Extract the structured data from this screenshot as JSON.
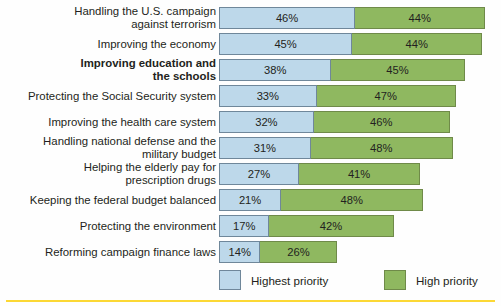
{
  "chart_data": {
    "type": "bar",
    "title": "",
    "xlabel": "",
    "ylabel": "",
    "orientation": "horizontal",
    "stacked": true,
    "grid": false,
    "legend_position": "bottom",
    "xlim": [
      0,
      90
    ],
    "axis_scale_px_per_percent": 2.96,
    "categories": [
      "Handling the U.S. campaign\nagainst terrorism",
      "Improving the economy",
      "Improving education and\nthe schools",
      "Protecting the Social Security system",
      "Improving the health care system",
      "Handling national defense and the\nmilitary budget",
      "Helping the elderly pay for\nprescription drugs",
      "Keeping the federal budget balanced",
      "Protecting the environment",
      "Reforming campaign finance laws"
    ],
    "series": [
      {
        "name": "Highest priority",
        "color": "#bdd8ea",
        "values": [
          46,
          45,
          38,
          33,
          32,
          31,
          27,
          21,
          17,
          14
        ],
        "labels": [
          "46%",
          "45%",
          "38%",
          "33%",
          "32%",
          "31%",
          "27%",
          "21%",
          "17%",
          "14%"
        ]
      },
      {
        "name": "High priority",
        "color": "#8fb860",
        "values": [
          44,
          44,
          45,
          47,
          46,
          48,
          41,
          48,
          42,
          26
        ],
        "labels": [
          "44%",
          "44%",
          "45%",
          "47%",
          "46%",
          "48%",
          "41%",
          "48%",
          "42%",
          "26%"
        ]
      }
    ],
    "emphasized_category_index": 2
  },
  "legend": {
    "items": [
      {
        "label": "Highest priority",
        "color": "#bdd8ea"
      },
      {
        "label": "High priority",
        "color": "#8fb860"
      }
    ]
  },
  "colors": {
    "highest_priority": "#bdd8ea",
    "high_priority": "#8fb860",
    "bar_border_blue": "#6f879a",
    "bar_border_green": "#6f8a49",
    "text": "#231f20",
    "bottom_rule": "#fcd835",
    "background": "#fefefe"
  }
}
